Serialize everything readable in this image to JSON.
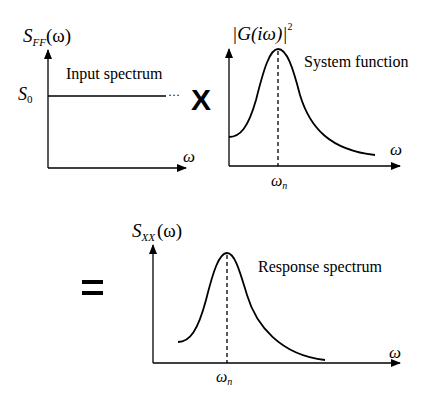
{
  "panels": {
    "input": {
      "y_label_main": "S",
      "y_label_sub": "FF",
      "y_label_arg": "(ω)",
      "level_label_main": "S",
      "level_label_sub": "0",
      "caption": "Input spectrum",
      "x_label": "ω",
      "continuation": "···"
    },
    "system": {
      "y_label": "|G(iω)|",
      "y_label_exp": "2",
      "caption": "System function",
      "x_label": "ω",
      "marker_main": "ω",
      "marker_sub": "n"
    },
    "response": {
      "y_label_main": "S",
      "y_label_sub": "XX",
      "y_label_arg": "(ω)",
      "caption": "Response spectrum",
      "x_label": "ω",
      "marker_main": "ω",
      "marker_sub": "n"
    }
  },
  "operators": {
    "multiply": "X",
    "equals": "="
  },
  "colors": {
    "line": "#000000",
    "background": "#ffffff"
  }
}
